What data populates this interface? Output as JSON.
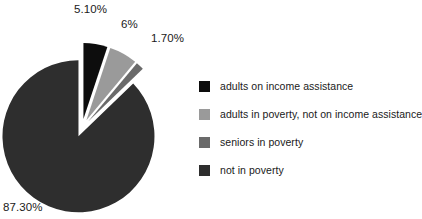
{
  "chart_data": {
    "type": "pie",
    "title": "",
    "subtitle": "",
    "xlabel": "",
    "ylabel": "",
    "legend_position": "right",
    "grid": false,
    "exploded": true,
    "start_angle_deg": -90,
    "categories": [
      "adults on income assistance",
      "adults in poverty, not on income assistance",
      "seniors in poverty",
      "not in poverty"
    ],
    "values": [
      5.1,
      6.0,
      1.7,
      87.3
    ],
    "data_labels": [
      "5.10%",
      "6%",
      "1.70%",
      "87.30%"
    ],
    "colors": [
      "#0d0d0d",
      "#9a9a9a",
      "#6a6a6a",
      "#2e2e2e"
    ],
    "slices": [
      {
        "label": "adults on income assistance",
        "value": 5.1,
        "data_label": "5.10%",
        "color": "#0d0d0d"
      },
      {
        "label": "adults in poverty, not on income assistance",
        "value": 6.0,
        "data_label": "6%",
        "color": "#9a9a9a"
      },
      {
        "label": "seniors in poverty",
        "value": 1.7,
        "data_label": "1.70%",
        "color": "#6a6a6a"
      },
      {
        "label": "not in poverty",
        "value": 87.3,
        "data_label": "87.30%",
        "color": "#2e2e2e"
      }
    ]
  },
  "legend": {
    "items": [
      {
        "label": "adults on income assistance",
        "color": "#0d0d0d"
      },
      {
        "label": "adults in poverty, not on income assistance",
        "color": "#9a9a9a"
      },
      {
        "label": "seniors in poverty",
        "color": "#6a6a6a"
      },
      {
        "label": "not in poverty",
        "color": "#2e2e2e"
      }
    ]
  }
}
